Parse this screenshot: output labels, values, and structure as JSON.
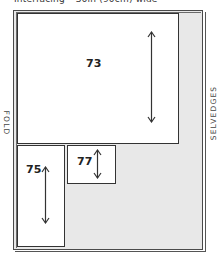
{
  "title": "Interfacing – 36in (90cm) wide",
  "labels": {
    "fold": "FOLD",
    "selvedges": "SELVEDGES"
  },
  "colors": {
    "fabric_fill": "#e8e8e8",
    "piece_fill": "#ffffff",
    "outline": "#333333"
  },
  "pieces": [
    {
      "id": "73",
      "label": "73",
      "grain_arrow": "vertical"
    },
    {
      "id": "75",
      "label": "75",
      "grain_arrow": "vertical"
    },
    {
      "id": "77",
      "label": "77",
      "grain_arrow": "vertical"
    }
  ]
}
